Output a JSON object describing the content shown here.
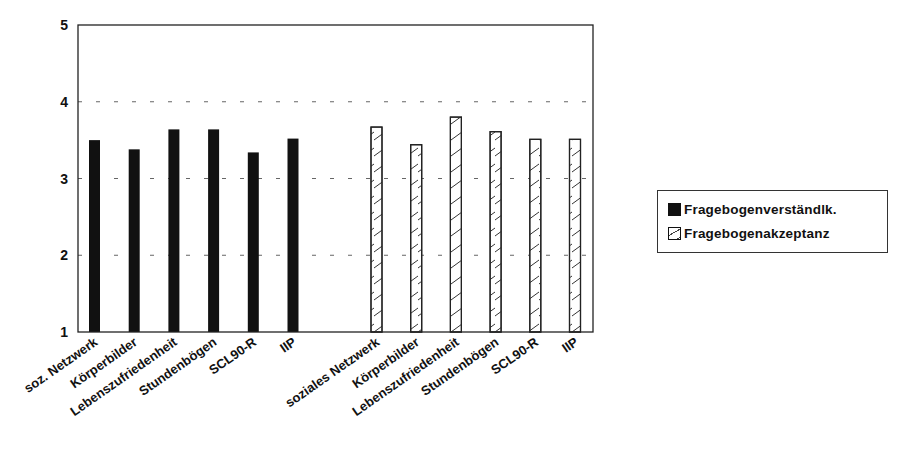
{
  "chart_data": {
    "type": "bar",
    "title": "",
    "xlabel": "",
    "ylabel": "",
    "ylim": [
      1,
      5
    ],
    "yticks": [
      1,
      2,
      3,
      4,
      5
    ],
    "grid": true,
    "legend_position": "right",
    "groups": [
      {
        "series": "Fragebogenverständlk.",
        "style": "solid",
        "categories": [
          "soz. Netzwerk",
          "Körperbilder",
          "Lebenszufriedenheit",
          "Stundenbögen",
          "SCL90-R",
          "IIP"
        ],
        "values": [
          3.5,
          3.38,
          3.64,
          3.64,
          3.34,
          3.52
        ]
      },
      {
        "series": "Fragebogenakzeptanz",
        "style": "hatched",
        "categories": [
          "soziales Netzwerk",
          "Körperbilder",
          "Lebenszufriedenheit",
          "Stundenbögen",
          "SCL90-R",
          "IIP"
        ],
        "values": [
          3.67,
          3.44,
          3.8,
          3.61,
          3.51,
          3.51
        ]
      }
    ],
    "legend": [
      {
        "label": "Fragebogenverständlk.",
        "style": "solid"
      },
      {
        "label": "Fragebogenakzeptanz",
        "style": "hatched"
      }
    ]
  },
  "colors": {
    "bar_solid": "#111111",
    "bar_hatch_fill": "#ffffff",
    "outline": "#222222",
    "grid": "#666666"
  }
}
